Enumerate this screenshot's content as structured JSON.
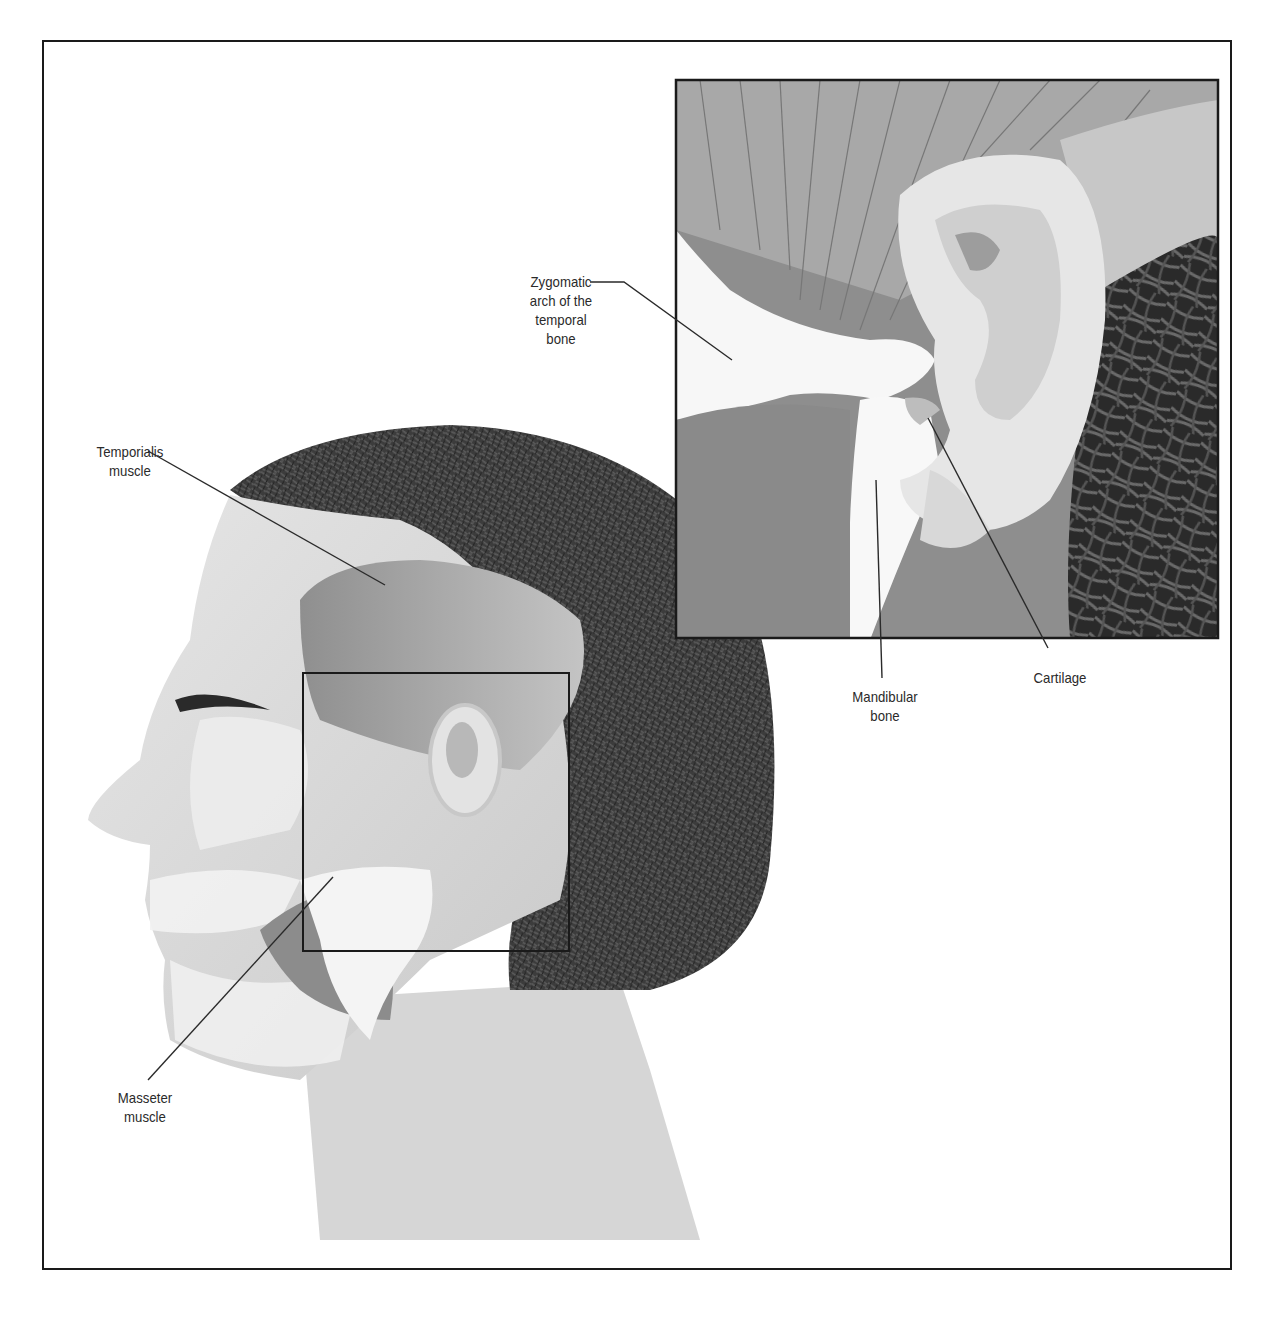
{
  "figure": {
    "main_view": "Lateral view of head showing muscles of mastication",
    "inset_view": "Enlarged view of temporomandibular joint region near the ear"
  },
  "labels": {
    "temporialis": {
      "line1": "Temporialis",
      "line2": "muscle"
    },
    "masseter": {
      "line1": "Masseter",
      "line2": "muscle"
    },
    "zygomatic": {
      "line1": "Zygomatic",
      "line2": "arch of the",
      "line3": "temporal",
      "line4": "bone"
    },
    "mandibular": {
      "line1": "Mandibular",
      "line2": "bone"
    },
    "cartilage": {
      "line1": "Cartilage"
    }
  },
  "colors": {
    "border": "#1a1a1a",
    "skin": "#d9d9d9",
    "muscle": "#9a9a9a",
    "bone": "#f4f4f4",
    "hair": "#3a3a3a",
    "leader": "#2a2a2a"
  }
}
